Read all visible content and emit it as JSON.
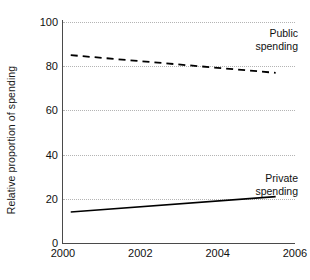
{
  "chart_data": {
    "type": "line",
    "title": "",
    "subtitle": "",
    "xlabel": "",
    "ylabel": "Relative proportion of spending",
    "xlim": [
      2000,
      2006
    ],
    "ylim": [
      0,
      100
    ],
    "grid": true,
    "grid_axis": "y",
    "grid_style": "dotted",
    "legend_position": "inline-annotation",
    "xticks": [
      2000,
      2002,
      2004,
      2006
    ],
    "xtick_labels": [
      "2000",
      "2002",
      "2004",
      "2006"
    ],
    "yticks": [
      0,
      20,
      40,
      60,
      80,
      100
    ],
    "ytick_labels": [
      "0",
      "20",
      "40",
      "60",
      "80",
      "100"
    ],
    "series": [
      {
        "name": "Public spending",
        "label_lines": [
          "Public",
          "spending"
        ],
        "style": "dashed",
        "color": "#000000",
        "x": [
          2000.2,
          2005.5
        ],
        "values": [
          85,
          77
        ]
      },
      {
        "name": "Private spending",
        "label_lines": [
          "Private",
          "spending"
        ],
        "style": "solid",
        "color": "#000000",
        "x": [
          2000.2,
          2005.5
        ],
        "values": [
          14,
          21
        ]
      }
    ],
    "annotations": [
      {
        "text": "Public spending",
        "x": 2005.6,
        "y": 93
      },
      {
        "text": "Private spending",
        "x": 2005.6,
        "y": 28
      }
    ]
  },
  "axes": {
    "y_title": "Relative proportion of spending",
    "y_ticks": [
      {
        "value": 100,
        "label": "100"
      },
      {
        "value": 80,
        "label": "80"
      },
      {
        "value": 60,
        "label": "60"
      },
      {
        "value": 40,
        "label": "40"
      },
      {
        "value": 20,
        "label": "20"
      },
      {
        "value": 0,
        "label": "0"
      }
    ],
    "x_ticks": [
      {
        "value": 2000,
        "label": "2000"
      },
      {
        "value": 2002,
        "label": "2002"
      },
      {
        "value": 2004,
        "label": "2004"
      },
      {
        "value": 2006,
        "label": "2006"
      }
    ]
  },
  "labels": {
    "public": {
      "line1": "Public",
      "line2": "spending"
    },
    "private": {
      "line1": "Private",
      "line2": "spending"
    }
  },
  "colors": {
    "axis": "#4a4a4a",
    "grid": "#b4b4b4",
    "series": "#000000",
    "text": "#111111",
    "background": "#ffffff"
  }
}
